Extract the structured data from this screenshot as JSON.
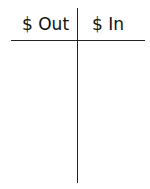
{
  "t_account": {
    "left_header": "$ Out",
    "right_header": "$ In",
    "left_entries": [],
    "right_entries": []
  }
}
